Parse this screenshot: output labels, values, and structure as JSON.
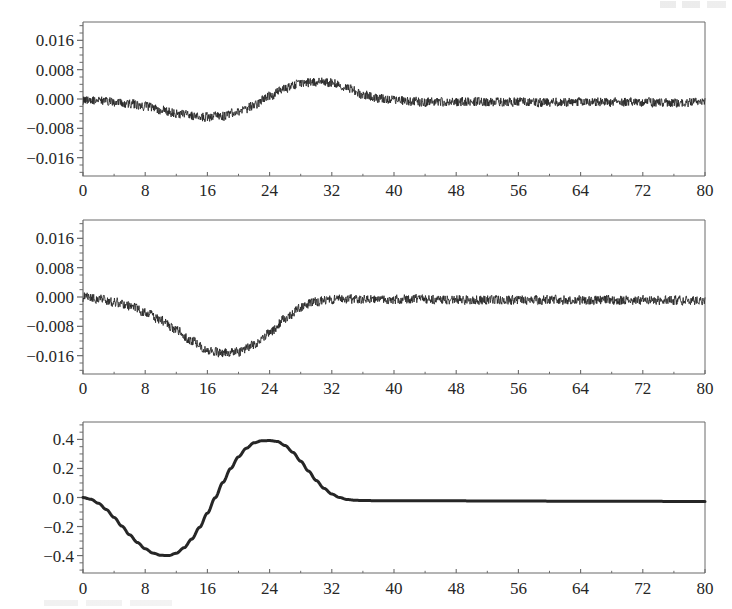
{
  "figure": {
    "kind": "scientific-figure",
    "background_color": "#ffffff",
    "ink_color": "#262626",
    "axis_color": "#6b6b6b",
    "panel_count": 3,
    "corner_artifact_label": "",
    "bottom_artifact_label": ""
  },
  "chart_data": [
    {
      "type": "line",
      "panel_index": 0,
      "title": "",
      "xlabel": "",
      "ylabel": "",
      "xlim": [
        0,
        80
      ],
      "ylim": [
        -0.021,
        0.021
      ],
      "xticks": [
        0,
        8,
        16,
        24,
        32,
        40,
        48,
        56,
        64,
        72,
        80
      ],
      "xticklabels": [
        "0",
        "8",
        "16",
        "24",
        "32",
        "40",
        "48",
        "56",
        "64",
        "72",
        "80"
      ],
      "yticks": [
        0.016,
        0.008,
        0.0,
        -0.008,
        -0.016
      ],
      "yticklabels": [
        "0.016",
        "0.008",
        "0.000",
        "−0.008",
        "−0.016"
      ],
      "minor_ticks_per_interval": 4,
      "grid": false,
      "legend": "none",
      "series": [
        {
          "name": "noisy signal 1",
          "noise_amplitude": 0.0013,
          "noise_seed": 11,
          "envelope_x": [
            0,
            2,
            4,
            6,
            8,
            10,
            12,
            14,
            16,
            18,
            20,
            22,
            24,
            26,
            28,
            30,
            32,
            34,
            36,
            38,
            40,
            44,
            48,
            52,
            56,
            60,
            64,
            68,
            72,
            76,
            80
          ],
          "envelope_y": [
            -0.0002,
            -0.0004,
            -0.0008,
            -0.0013,
            -0.0021,
            -0.003,
            -0.0039,
            -0.0046,
            -0.0049,
            -0.0046,
            -0.0036,
            -0.0018,
            0.0008,
            0.003,
            0.0043,
            0.0047,
            0.0044,
            0.0029,
            0.0012,
            0.0002,
            -0.0004,
            -0.0008,
            -0.0008,
            -0.0008,
            -0.0008,
            -0.0009,
            -0.0008,
            -0.0009,
            -0.0009,
            -0.0009,
            -0.0009
          ]
        }
      ]
    },
    {
      "type": "line",
      "panel_index": 1,
      "title": "",
      "xlabel": "",
      "ylabel": "",
      "xlim": [
        0,
        80
      ],
      "ylim": [
        -0.021,
        0.021
      ],
      "xticks": [
        0,
        8,
        16,
        24,
        32,
        40,
        48,
        56,
        64,
        72,
        80
      ],
      "xticklabels": [
        "0",
        "8",
        "16",
        "24",
        "32",
        "40",
        "48",
        "56",
        "64",
        "72",
        "80"
      ],
      "yticks": [
        0.016,
        0.008,
        0.0,
        -0.008,
        -0.016
      ],
      "yticklabels": [
        "0.016",
        "0.008",
        "0.000",
        "−0.008",
        "−0.016"
      ],
      "minor_ticks_per_interval": 4,
      "grid": false,
      "legend": "none",
      "series": [
        {
          "name": "noisy signal 2",
          "noise_amplitude": 0.0013,
          "noise_seed": 29,
          "envelope_x": [
            0,
            2,
            4,
            6,
            8,
            10,
            12,
            14,
            16,
            18,
            20,
            22,
            24,
            26,
            28,
            30,
            32,
            34,
            36,
            40,
            44,
            48,
            52,
            56,
            60,
            64,
            68,
            72,
            76,
            80
          ],
          "envelope_y": [
            0.0,
            -0.0006,
            -0.0014,
            -0.0026,
            -0.0042,
            -0.0063,
            -0.009,
            -0.012,
            -0.0144,
            -0.0153,
            -0.015,
            -0.0132,
            -0.0098,
            -0.006,
            -0.0028,
            -0.0012,
            -0.0006,
            -0.0006,
            -0.0007,
            -0.0007,
            -0.0006,
            -0.0007,
            -0.0008,
            -0.0008,
            -0.0008,
            -0.0009,
            -0.0008,
            -0.0009,
            -0.0009,
            -0.001
          ]
        }
      ]
    },
    {
      "type": "line",
      "panel_index": 2,
      "title": "",
      "xlabel": "",
      "ylabel": "",
      "xlim": [
        0,
        80
      ],
      "ylim": [
        -0.52,
        0.52
      ],
      "xticks": [
        0,
        8,
        16,
        24,
        32,
        40,
        48,
        56,
        64,
        72,
        80
      ],
      "xticklabels": [
        "0",
        "8",
        "16",
        "24",
        "32",
        "40",
        "48",
        "56",
        "64",
        "72",
        "80"
      ],
      "yticks": [
        0.4,
        0.2,
        0.0,
        -0.2,
        -0.4
      ],
      "yticklabels": [
        "0.4",
        "0.2",
        "0.0",
        "−0.2",
        "−0.4"
      ],
      "minor_ticks_per_interval": 4,
      "grid": false,
      "legend": "none",
      "series": [
        {
          "name": "smooth wavelet",
          "noise_amplitude": 0,
          "noise_seed": 0,
          "line_width": 3,
          "envelope_x": [
            0,
            1,
            2,
            3,
            4,
            5,
            6,
            7,
            8,
            9,
            10,
            11,
            12,
            13,
            14,
            15,
            16,
            17,
            18,
            19,
            20,
            21,
            22,
            23,
            24,
            25,
            26,
            27,
            28,
            29,
            30,
            31,
            32,
            33,
            34,
            35,
            36,
            38,
            40,
            44,
            48,
            52,
            56,
            60,
            64,
            68,
            72,
            76,
            80
          ],
          "envelope_y": [
            0.0,
            -0.012,
            -0.04,
            -0.083,
            -0.137,
            -0.197,
            -0.257,
            -0.31,
            -0.353,
            -0.383,
            -0.398,
            -0.4,
            -0.384,
            -0.346,
            -0.286,
            -0.205,
            -0.108,
            -0.002,
            0.104,
            0.2,
            0.28,
            0.339,
            0.377,
            0.391,
            0.392,
            0.386,
            0.358,
            0.311,
            0.25,
            0.182,
            0.117,
            0.063,
            0.024,
            0.0,
            -0.014,
            -0.019,
            -0.021,
            -0.022,
            -0.022,
            -0.023,
            -0.023,
            -0.024,
            -0.024,
            -0.025,
            -0.025,
            -0.026,
            -0.026,
            -0.027,
            -0.027
          ]
        }
      ]
    }
  ]
}
